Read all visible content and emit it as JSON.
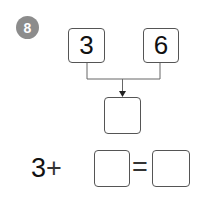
{
  "problem": {
    "number": "8",
    "addends": [
      "3",
      "6"
    ],
    "sum_box": "",
    "equation": {
      "left_operand": "3",
      "operator": "+",
      "missing_operand": "",
      "equals": "=",
      "result": ""
    }
  },
  "colors": {
    "badge": "#8c8c8c",
    "box_border": "#555555",
    "line": "#666666"
  }
}
